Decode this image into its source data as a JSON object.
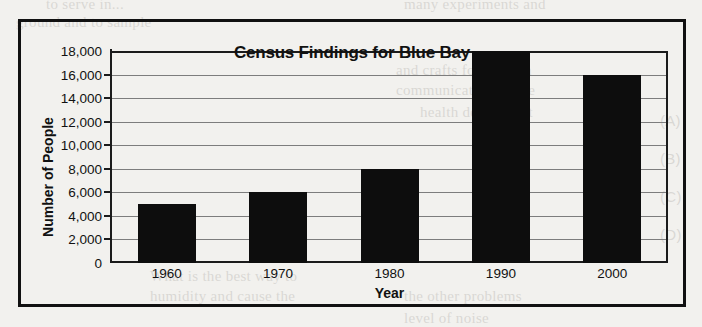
{
  "chart_data": {
    "type": "bar",
    "title": "Census Findings for Blue Bay",
    "xlabel": "Year",
    "ylabel": "Number of People",
    "categories": [
      "1960",
      "1970",
      "1980",
      "1990",
      "2000"
    ],
    "values": [
      5000,
      6000,
      8000,
      18000,
      16000
    ],
    "ylim": [
      0,
      18000
    ],
    "ytick_values": [
      0,
      2000,
      4000,
      6000,
      8000,
      10000,
      12000,
      14000,
      16000,
      18000
    ],
    "ytick_labels": [
      "0",
      "2,000",
      "4,000",
      "6,000",
      "8,000",
      "10,000",
      "12,000",
      "14,000",
      "16,000",
      "18,000"
    ],
    "grid": true,
    "legend": false,
    "bar_color": "#0d0d0d",
    "gridline_color": "#7d7d7d",
    "axis_color": "#1b1b1b",
    "frame_color": "#111111",
    "background_color": "#f2f1ee"
  },
  "texture": {
    "line_tl": "to serve in...",
    "line_tl2": "ground and to sample",
    "line_tr": "many experiments and",
    "line_r1": "and crafts for can can",
    "line_r2": "communicate with the",
    "line_r3": "health department",
    "line_b1": "What is the best way to",
    "line_b2": "humidity and cause the",
    "line_b3": "the other problems",
    "line_b4": "level of noise",
    "opt_a": "(A)",
    "opt_b": "(B)",
    "opt_c": "(C)",
    "opt_d": "(D)"
  }
}
